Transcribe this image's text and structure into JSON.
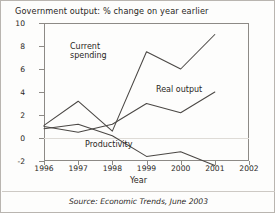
{
  "figure": {
    "title": "Government output: % change on year earlier",
    "source": "Source: Economic Trends, June 2003",
    "axis_x_label": "Year"
  },
  "chart_data": {
    "type": "line",
    "title": "Government output: % change on year earlier",
    "xlabel": "Year",
    "ylabel": "",
    "x": [
      1996,
      1997,
      1998,
      1999,
      2000,
      2001
    ],
    "xlim": [
      1996,
      2002
    ],
    "ylim": [
      -2,
      10
    ],
    "xticks": [
      1996,
      1997,
      1998,
      1999,
      2000,
      2001,
      2002
    ],
    "yticks": [
      -2,
      0,
      2,
      4,
      6,
      8,
      10
    ],
    "grid": false,
    "zero_line": true,
    "legend_position": "inline-annotations",
    "series": [
      {
        "name": "Current spending",
        "values": [
          1.1,
          3.2,
          0.6,
          7.5,
          6.0,
          9.0
        ],
        "label_text": "Current\nspending"
      },
      {
        "name": "Real output",
        "values": [
          1.0,
          0.5,
          1.2,
          3.0,
          2.2,
          4.0
        ],
        "label_text": "Real output"
      },
      {
        "name": "Productivity",
        "values": [
          0.8,
          1.2,
          0.2,
          -1.6,
          -1.2,
          -2.4
        ],
        "label_text": "Productivity"
      }
    ]
  }
}
